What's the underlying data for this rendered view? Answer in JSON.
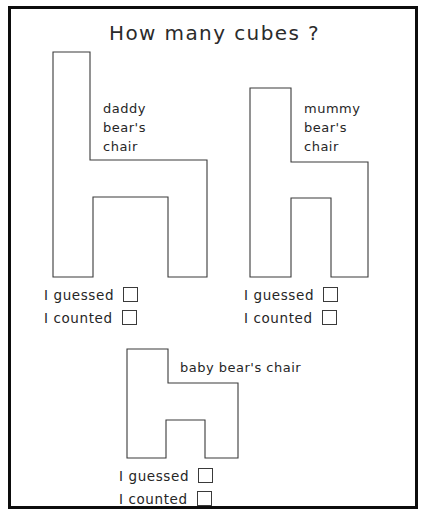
{
  "page": {
    "title": "How many cubes ?",
    "background_color": "#ffffff",
    "ink_color": "#3a3a3a",
    "frame_color": "#0d0d0d"
  },
  "answer_labels": {
    "guessed": "I guessed",
    "counted": "I counted"
  },
  "figures": [
    {
      "id": "daddy",
      "label": "daddy\nbear's\nchair",
      "shape": "chair-h-large",
      "points": "53,52 90,52 90,160 207,160 207,277 168,277 168,197 93,197 93,277 53,277",
      "answers": {
        "guessed": "I guessed",
        "counted": "I counted"
      }
    },
    {
      "id": "mummy",
      "label": "mummy\nbear's\nchair",
      "shape": "chair-h-medium",
      "points": "250,88 291,88 291,162 368,162 368,277 331,277 331,198 291,198 291,277 250,277",
      "answers": {
        "guessed": "I guessed",
        "counted": "I counted"
      }
    },
    {
      "id": "baby",
      "label": "baby bear's chair",
      "shape": "chair-h-small",
      "points": "127,349 168,349 168,383 238,383 238,458 205,458 205,420 166,420 166,458 127,458",
      "answers": {
        "guessed": "I guessed",
        "counted": "I counted"
      }
    }
  ]
}
